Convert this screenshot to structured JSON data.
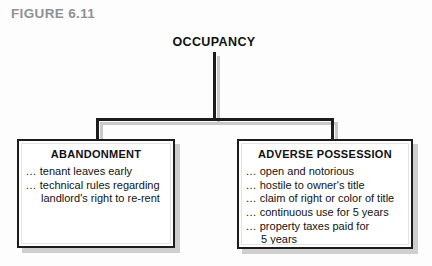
{
  "figure": {
    "caption": "FIGURE 6.11",
    "caption_color": "#8f9194"
  },
  "diagram": {
    "type": "tree",
    "root": {
      "label": "OCCUPANCY"
    },
    "nodes": [
      {
        "id": "abandonment",
        "heading": "ABANDONMENT",
        "items": [
          {
            "lead": "...",
            "text": "tenant leaves early",
            "continuation": ""
          },
          {
            "lead": "...",
            "text": "technical rules regarding",
            "continuation": "landlord's right to re-rent"
          }
        ]
      },
      {
        "id": "adverse-possession",
        "heading": "ADVERSE POSSESSION",
        "items": [
          {
            "lead": "...",
            "text": "open and notorious",
            "continuation": ""
          },
          {
            "lead": "...",
            "text": "hostile to owner's title",
            "continuation": ""
          },
          {
            "lead": "...",
            "text": "claim of right or color of title",
            "continuation": ""
          },
          {
            "lead": "...",
            "text": "continuous use for 5 years",
            "continuation": ""
          },
          {
            "lead": "...",
            "text": "property taxes paid for",
            "continuation": "5 years"
          }
        ]
      }
    ],
    "colors": {
      "line": "#1c1c1c",
      "shadow": "#cfcfcf",
      "box_fill": "#ffffff",
      "text": "#111111"
    }
  }
}
